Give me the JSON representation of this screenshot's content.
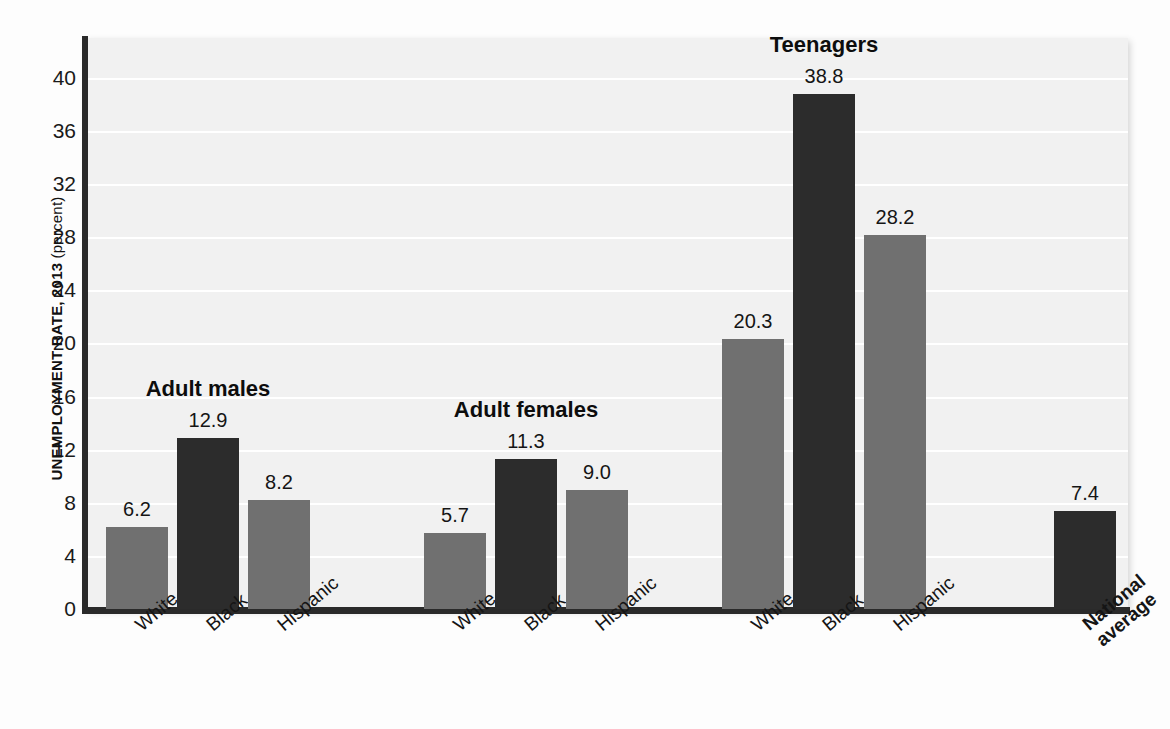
{
  "figure": {
    "y_axis_title_main": "UNEMPLOYMENT RATE, 2013",
    "y_axis_title_unit": "(percent)"
  },
  "bleed_text": [
    "household survey to measure unemployment in the",
    "people are counted as unemployed",
    "the labor force participation rate and the",
    "employment rate for different groups",
    "the unemployment rate understates",
    "discouraged workers who have",
    "marginally attached to the labor",
    "that the official measure",
    "rates vary widely across",
    "teenagers face the highest"
  ],
  "chart_data": {
    "type": "bar",
    "title": "",
    "xlabel": "",
    "ylabel": "UNEMPLOYMENT RATE, 2013 (percent)",
    "ylim": [
      0,
      43
    ],
    "yticks": [
      0,
      4,
      8,
      12,
      16,
      20,
      24,
      28,
      32,
      36,
      40
    ],
    "ytick_labels": [
      "0",
      "4",
      "8",
      "12",
      "16",
      "20",
      "24",
      "28",
      "32",
      "36",
      "40"
    ],
    "grid": "horizontal-white",
    "legend": "none",
    "categories": [
      "White",
      "Black",
      "Hispanic"
    ],
    "colors": {
      "gray_bar": "#707070",
      "dark_bar": "#2c2c2c",
      "plot_background": "#f1f1f1",
      "gridline": "#ffffff",
      "axis": "#2a2a2a"
    },
    "groups": [
      {
        "name": "Adult males",
        "heading": "Adult males",
        "bars": [
          {
            "label": "White",
            "value": 6.2,
            "value_text": "6.2",
            "color": "gray"
          },
          {
            "label": "Black",
            "value": 12.9,
            "value_text": "12.9",
            "color": "dark"
          },
          {
            "label": "Hispanic",
            "value": 8.2,
            "value_text": "8.2",
            "color": "gray"
          }
        ]
      },
      {
        "name": "Adult females",
        "heading": "Adult females",
        "bars": [
          {
            "label": "White",
            "value": 5.7,
            "value_text": "5.7",
            "color": "gray"
          },
          {
            "label": "Black",
            "value": 11.3,
            "value_text": "11.3",
            "color": "dark"
          },
          {
            "label": "Hispanic",
            "value": 9.0,
            "value_text": "9.0",
            "color": "gray"
          }
        ]
      },
      {
        "name": "Teenagers",
        "heading": "Teenagers",
        "bars": [
          {
            "label": "White",
            "value": 20.3,
            "value_text": "20.3",
            "color": "gray"
          },
          {
            "label": "Black",
            "value": 38.8,
            "value_text": "38.8",
            "color": "dark"
          },
          {
            "label": "Hispanic",
            "value": 28.2,
            "value_text": "28.2",
            "color": "gray"
          }
        ]
      },
      {
        "name": "National average",
        "heading": "",
        "bars": [
          {
            "label": "National\naverage",
            "value": 7.4,
            "value_text": "7.4",
            "color": "dark",
            "bold_label": true
          }
        ]
      }
    ]
  }
}
